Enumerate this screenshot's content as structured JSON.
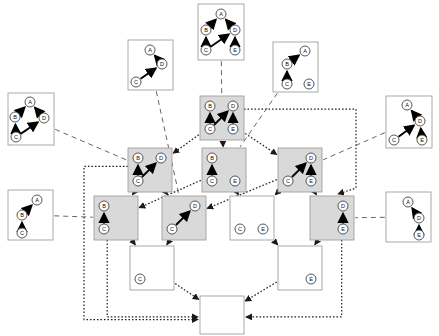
{
  "figure": {
    "type": "subgraph-lattice-diagram",
    "node_labels": [
      "A",
      "B",
      "C",
      "D",
      "E"
    ],
    "colors": {
      "lattice_node_fill": "#d9d9d9",
      "empty_node_fill": "#ffffff",
      "box_border": "#a0a0a0",
      "vertex_fill": "#ffffff",
      "vertex_stroke": "#444444",
      "edge_color": "#000000",
      "lattice_arrow_color": "#222222",
      "annotation_line_color": "#666666"
    },
    "line_styles": {
      "lattice_edges": "dotted-with-arrowheads",
      "annotation_links": "dashed",
      "graph_edges": "solid-thick-with-arrowheads"
    }
  },
  "outer_graphs": [
    {
      "id": "outer-top-center",
      "x": 198,
      "y": 4,
      "w": 46,
      "h": 56,
      "fill": "#ffffff",
      "vertices": [
        {
          "label": "A",
          "x": 23,
          "y": 10
        },
        {
          "label": "B",
          "x": 8,
          "y": 26
        },
        {
          "label": "C",
          "x": 8,
          "y": 46
        },
        {
          "label": "D",
          "x": 37,
          "y": 26
        },
        {
          "label": "E",
          "x": 37,
          "y": 46
        }
      ],
      "edges": [
        {
          "from": "B",
          "to": "A"
        },
        {
          "from": "D",
          "to": "A"
        },
        {
          "from": "C",
          "to": "B"
        },
        {
          "from": "C",
          "to": "D"
        },
        {
          "from": "E",
          "to": "D"
        }
      ]
    },
    {
      "id": "outer-upper-left-AD-C",
      "x": 128,
      "y": 40,
      "w": 45,
      "h": 50,
      "fill": "#ffffff",
      "vertices": [
        {
          "label": "A",
          "x": 22,
          "y": 10
        },
        {
          "label": "D",
          "x": 34,
          "y": 24
        },
        {
          "label": "C",
          "x": 8,
          "y": 42
        }
      ],
      "edges": [
        {
          "from": "D",
          "to": "A"
        },
        {
          "from": "C",
          "to": "D"
        }
      ]
    },
    {
      "id": "outer-upper-right-ABC-E",
      "x": 273,
      "y": 42,
      "w": 45,
      "h": 50,
      "fill": "#ffffff",
      "vertices": [
        {
          "label": "A",
          "x": 32,
          "y": 9
        },
        {
          "label": "B",
          "x": 14,
          "y": 22
        },
        {
          "label": "C",
          "x": 14,
          "y": 42
        },
        {
          "label": "E",
          "x": 36,
          "y": 42
        }
      ],
      "edges": [
        {
          "from": "B",
          "to": "A"
        },
        {
          "from": "C",
          "to": "B"
        }
      ]
    },
    {
      "id": "outer-far-left-top",
      "x": 8,
      "y": 93,
      "w": 46,
      "h": 52,
      "fill": "#ffffff",
      "vertices": [
        {
          "label": "A",
          "x": 22,
          "y": 9
        },
        {
          "label": "B",
          "x": 7,
          "y": 24
        },
        {
          "label": "C",
          "x": 8,
          "y": 44
        },
        {
          "label": "D",
          "x": 36,
          "y": 25
        }
      ],
      "edges": [
        {
          "from": "B",
          "to": "A"
        },
        {
          "from": "D",
          "to": "A"
        },
        {
          "from": "C",
          "to": "B"
        },
        {
          "from": "C",
          "to": "D"
        }
      ]
    },
    {
      "id": "outer-far-right-top",
      "x": 386,
      "y": 96,
      "w": 46,
      "h": 52,
      "fill": "#ffffff",
      "vertices": [
        {
          "label": "A",
          "x": 21,
          "y": 9
        },
        {
          "label": "D",
          "x": 34,
          "y": 25
        },
        {
          "label": "C",
          "x": 8,
          "y": 44
        },
        {
          "label": "E",
          "x": 36,
          "y": 44
        }
      ],
      "edges": [
        {
          "from": "D",
          "to": "A"
        },
        {
          "from": "C",
          "to": "D"
        },
        {
          "from": "E",
          "to": "D"
        }
      ]
    },
    {
      "id": "outer-far-left-bottom",
      "x": 8,
      "y": 190,
      "w": 45,
      "h": 50,
      "fill": "#ffffff",
      "vertices": [
        {
          "label": "A",
          "x": 29,
          "y": 10
        },
        {
          "label": "B",
          "x": 14,
          "y": 25
        },
        {
          "label": "C",
          "x": 14,
          "y": 43
        }
      ],
      "edges": [
        {
          "from": "B",
          "to": "A"
        },
        {
          "from": "C",
          "to": "B"
        }
      ]
    },
    {
      "id": "outer-far-right-bottom",
      "x": 386,
      "y": 192,
      "w": 45,
      "h": 50,
      "fill": "#ffffff",
      "vertices": [
        {
          "label": "A",
          "x": 22,
          "y": 10
        },
        {
          "label": "D",
          "x": 33,
          "y": 26
        },
        {
          "label": "E",
          "x": 33,
          "y": 43
        }
      ],
      "edges": [
        {
          "from": "D",
          "to": "A"
        },
        {
          "from": "E",
          "to": "D"
        }
      ]
    }
  ],
  "lattice_nodes": [
    {
      "id": "lat-L1-BDCE",
      "level": 1,
      "x": 200,
      "y": 96,
      "w": 44,
      "h": 44,
      "fill": "#d9d9d9",
      "vertices": [
        {
          "label": "B",
          "x": 10,
          "y": 10
        },
        {
          "label": "D",
          "x": 33,
          "y": 10
        },
        {
          "label": "C",
          "x": 10,
          "y": 33
        },
        {
          "label": "E",
          "x": 33,
          "y": 33
        }
      ],
      "edges": [
        {
          "from": "C",
          "to": "B"
        },
        {
          "from": "C",
          "to": "D"
        },
        {
          "from": "E",
          "to": "D"
        }
      ]
    },
    {
      "id": "lat-L2-BDC",
      "level": 2,
      "x": 128,
      "y": 148,
      "w": 44,
      "h": 44,
      "fill": "#d9d9d9",
      "vertices": [
        {
          "label": "B",
          "x": 10,
          "y": 10
        },
        {
          "label": "D",
          "x": 33,
          "y": 10
        },
        {
          "label": "C",
          "x": 10,
          "y": 33
        }
      ],
      "edges": [
        {
          "from": "C",
          "to": "B"
        },
        {
          "from": "C",
          "to": "D"
        }
      ]
    },
    {
      "id": "lat-L2-BC-E",
      "level": 2,
      "x": 202,
      "y": 148,
      "w": 44,
      "h": 44,
      "fill": "#d9d9d9",
      "vertices": [
        {
          "label": "B",
          "x": 10,
          "y": 10
        },
        {
          "label": "C",
          "x": 10,
          "y": 33
        },
        {
          "label": "E",
          "x": 33,
          "y": 33
        }
      ],
      "edges": [
        {
          "from": "C",
          "to": "B"
        }
      ]
    },
    {
      "id": "lat-L2-CDE",
      "level": 2,
      "x": 278,
      "y": 148,
      "w": 44,
      "h": 44,
      "fill": "#d9d9d9",
      "vertices": [
        {
          "label": "D",
          "x": 33,
          "y": 10
        },
        {
          "label": "C",
          "x": 10,
          "y": 33
        },
        {
          "label": "E",
          "x": 33,
          "y": 33
        }
      ],
      "edges": [
        {
          "from": "C",
          "to": "D"
        },
        {
          "from": "E",
          "to": "D"
        }
      ]
    },
    {
      "id": "lat-L3-BC",
      "level": 3,
      "x": 94,
      "y": 196,
      "w": 44,
      "h": 44,
      "fill": "#d9d9d9",
      "vertices": [
        {
          "label": "B",
          "x": 10,
          "y": 10
        },
        {
          "label": "C",
          "x": 10,
          "y": 33
        }
      ],
      "edges": [
        {
          "from": "C",
          "to": "B"
        }
      ]
    },
    {
      "id": "lat-L3-CD",
      "level": 3,
      "x": 162,
      "y": 196,
      "w": 44,
      "h": 44,
      "fill": "#d9d9d9",
      "vertices": [
        {
          "label": "D",
          "x": 33,
          "y": 10
        },
        {
          "label": "C",
          "x": 10,
          "y": 33
        }
      ],
      "edges": [
        {
          "from": "C",
          "to": "D"
        }
      ]
    },
    {
      "id": "lat-L3-C-E",
      "level": 3,
      "x": 230,
      "y": 196,
      "w": 44,
      "h": 44,
      "fill": "#ffffff",
      "vertices": [
        {
          "label": "C",
          "x": 10,
          "y": 33
        },
        {
          "label": "E",
          "x": 33,
          "y": 33
        }
      ],
      "edges": []
    },
    {
      "id": "lat-L3-DE",
      "level": 3,
      "x": 310,
      "y": 196,
      "w": 44,
      "h": 44,
      "fill": "#d9d9d9",
      "vertices": [
        {
          "label": "D",
          "x": 33,
          "y": 10
        },
        {
          "label": "E",
          "x": 33,
          "y": 33
        }
      ],
      "edges": [
        {
          "from": "E",
          "to": "D"
        }
      ]
    },
    {
      "id": "lat-L4-C",
      "level": 4,
      "x": 130,
      "y": 246,
      "w": 44,
      "h": 44,
      "fill": "#ffffff",
      "vertices": [
        {
          "label": "C",
          "x": 10,
          "y": 33
        }
      ],
      "edges": []
    },
    {
      "id": "lat-L4-E",
      "level": 4,
      "x": 278,
      "y": 246,
      "w": 44,
      "h": 44,
      "fill": "#ffffff",
      "vertices": [
        {
          "label": "E",
          "x": 33,
          "y": 33
        }
      ],
      "edges": []
    },
    {
      "id": "lat-L5-empty",
      "level": 5,
      "x": 200,
      "y": 296,
      "w": 44,
      "h": 38,
      "fill": "#ffffff",
      "vertices": [],
      "edges": []
    }
  ],
  "lattice_links": [
    {
      "from": "lat-L1-BDCE",
      "to": "lat-L2-BDC"
    },
    {
      "from": "lat-L1-BDCE",
      "to": "lat-L2-BC-E"
    },
    {
      "from": "lat-L1-BDCE",
      "to": "lat-L2-CDE"
    },
    {
      "from": "lat-L2-BDC",
      "to": "lat-L3-BC"
    },
    {
      "from": "lat-L2-BDC",
      "to": "lat-L3-CD"
    },
    {
      "from": "lat-L2-BC-E",
      "to": "lat-L3-BC"
    },
    {
      "from": "lat-L2-BC-E",
      "to": "lat-L3-C-E"
    },
    {
      "from": "lat-L2-CDE",
      "to": "lat-L3-CD"
    },
    {
      "from": "lat-L2-CDE",
      "to": "lat-L3-C-E"
    },
    {
      "from": "lat-L2-CDE",
      "to": "lat-L3-DE"
    },
    {
      "from": "lat-L3-BC",
      "to": "lat-L4-C"
    },
    {
      "from": "lat-L3-CD",
      "to": "lat-L4-C"
    },
    {
      "from": "lat-L3-C-E",
      "to": "lat-L4-E"
    },
    {
      "from": "lat-L3-DE",
      "to": "lat-L4-E"
    },
    {
      "from": "lat-L4-C",
      "to": "lat-L5-empty"
    },
    {
      "from": "lat-L4-E",
      "to": "lat-L5-empty"
    },
    {
      "from": "lat-L1-BDCE",
      "to": "lat-L3-DE",
      "routing": "right-side-bus"
    },
    {
      "from": "lat-L2-BDC",
      "to": "lat-L5-empty",
      "routing": "left-side-bus"
    },
    {
      "from": "lat-L3-BC",
      "to": "lat-L5-empty",
      "routing": "left-vertical"
    },
    {
      "from": "lat-L3-DE",
      "to": "lat-L5-empty",
      "routing": "right-vertical"
    }
  ],
  "annotation_links": [
    {
      "from": "outer-top-center",
      "to": "lat-L1-BDCE"
    },
    {
      "from": "outer-upper-left-AD-C",
      "to": "lat-L3-CD"
    },
    {
      "from": "outer-upper-right-ABC-E",
      "to": "lat-L2-BC-E"
    },
    {
      "from": "outer-far-left-top",
      "to": "lat-L2-BDC"
    },
    {
      "from": "outer-far-right-top",
      "to": "lat-L2-CDE"
    },
    {
      "from": "outer-far-left-bottom",
      "to": "lat-L3-BC"
    },
    {
      "from": "outer-far-right-bottom",
      "to": "lat-L3-DE"
    }
  ]
}
